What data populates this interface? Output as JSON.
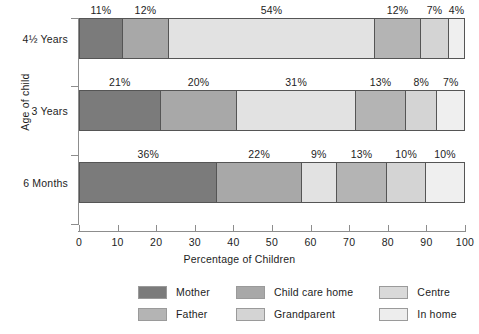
{
  "chart_data": {
    "type": "bar",
    "orientation": "horizontal",
    "stacked": true,
    "stack_mode": "percent",
    "title": "",
    "xlabel": "Percentage of Children",
    "ylabel": "Age of child",
    "xlim": [
      0,
      100
    ],
    "xticks": [
      0,
      10,
      20,
      30,
      40,
      50,
      60,
      70,
      80,
      90,
      100
    ],
    "xtick_labels": [
      "0",
      "10",
      "20",
      "30",
      "40",
      "50",
      "60",
      "70",
      "80",
      "90",
      "100"
    ],
    "grid": false,
    "legend_position": "bottom",
    "categories": [
      "4½ Years",
      "3 Years",
      "6 Months"
    ],
    "series": [
      {
        "name": "Mother",
        "color": "#7b7b7b",
        "values": [
          11,
          21,
          36
        ]
      },
      {
        "name": "Father",
        "color": "#a8a8a8",
        "values": [
          12,
          20,
          22
        ]
      },
      {
        "name": "Child care home",
        "color": "#e2e2e2",
        "values": [
          54,
          31,
          9
        ]
      },
      {
        "name": "Grandparent",
        "color": "#b4b4b4",
        "values": [
          12,
          13,
          13
        ]
      },
      {
        "name": "Centre",
        "color": "#d4d4d4",
        "values": [
          7,
          8,
          10
        ]
      },
      {
        "name": "In home",
        "color": "#efefef",
        "values": [
          4,
          7,
          10
        ]
      }
    ],
    "bars": [
      {
        "category": "4½ Years",
        "segments": [
          {
            "series": "Mother",
            "value": 11,
            "label": "11%",
            "color": "#7b7b7b"
          },
          {
            "series": "Father",
            "value": 12,
            "label": "12%",
            "color": "#a8a8a8"
          },
          {
            "series": "Child care home",
            "value": 54,
            "label": "54%",
            "color": "#e2e2e2"
          },
          {
            "series": "Grandparent",
            "value": 12,
            "label": "12%",
            "color": "#b4b4b4"
          },
          {
            "series": "Centre",
            "value": 7,
            "label": "7%",
            "color": "#d4d4d4"
          },
          {
            "series": "In home",
            "value": 4,
            "label": "4%",
            "color": "#efefef"
          }
        ]
      },
      {
        "category": "3 Years",
        "segments": [
          {
            "series": "Mother",
            "value": 21,
            "label": "21%",
            "color": "#7b7b7b"
          },
          {
            "series": "Father",
            "value": 20,
            "label": "20%",
            "color": "#a8a8a8"
          },
          {
            "series": "Child care home",
            "value": 31,
            "label": "31%",
            "color": "#e2e2e2"
          },
          {
            "series": "Grandparent",
            "value": 13,
            "label": "13%",
            "color": "#b4b4b4"
          },
          {
            "series": "Centre",
            "value": 8,
            "label": "8%",
            "color": "#d4d4d4"
          },
          {
            "series": "In home",
            "value": 7,
            "label": "7%",
            "color": "#efefef"
          }
        ]
      },
      {
        "category": "6 Months",
        "segments": [
          {
            "series": "Mother",
            "value": 36,
            "label": "36%",
            "color": "#7b7b7b"
          },
          {
            "series": "Father",
            "value": 22,
            "label": "22%",
            "color": "#a8a8a8"
          },
          {
            "series": "Child care home",
            "value": 9,
            "label": "9%",
            "color": "#e2e2e2"
          },
          {
            "series": "Grandparent",
            "value": 13,
            "label": "13%",
            "color": "#b4b4b4"
          },
          {
            "series": "Centre",
            "value": 10,
            "label": "10%",
            "color": "#d4d4d4"
          },
          {
            "series": "In home",
            "value": 10,
            "label": "10%",
            "color": "#efefef"
          }
        ]
      }
    ],
    "legend_entries": [
      {
        "label": "Mother",
        "color": "#7b7b7b"
      },
      {
        "label": "Child care home",
        "color": "#a8a8a8"
      },
      {
        "label": "Centre",
        "color": "#d9d9d9"
      },
      {
        "label": "Father",
        "color": "#b4b4b4"
      },
      {
        "label": "Grandparent",
        "color": "#d4d4d4"
      },
      {
        "label": "In home",
        "color": "#ededed"
      }
    ]
  },
  "axes": {
    "x_title": "Percentage of Children",
    "y_title": "Age of child"
  }
}
